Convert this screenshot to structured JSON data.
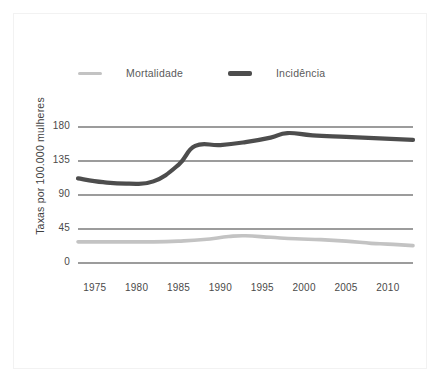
{
  "chart_data": {
    "type": "line",
    "title": "",
    "xlabel": "",
    "ylabel": "Taxas por 100.000 mulheres",
    "xlim": [
      1973,
      2013
    ],
    "ylim": [
      0,
      180
    ],
    "grid": true,
    "legend_position": "top",
    "y_ticks": [
      0,
      45,
      90,
      135,
      180
    ],
    "y_tick_labels": [
      "0",
      "45",
      "90",
      "135",
      "180"
    ],
    "x_ticks": [
      1975,
      1980,
      1985,
      1990,
      1995,
      2000,
      2005,
      2010
    ],
    "x_tick_labels": [
      "1975",
      "1980",
      "1985",
      "1990",
      "1995",
      "2000",
      "2005",
      "2010"
    ],
    "series": [
      {
        "name": "Mortalidade",
        "color": "#c3c3c3",
        "x": [
          1973,
          1976,
          1979,
          1982,
          1985,
          1988,
          1991,
          1993,
          1996,
          1999,
          2002,
          2005,
          2008,
          2010,
          2013
        ],
        "values": [
          28,
          28,
          28,
          28,
          29,
          31,
          35,
          36,
          34,
          32,
          31,
          29,
          26,
          25,
          23
        ]
      },
      {
        "name": "Incidência",
        "color": "#4d4d4d",
        "x": [
          1973,
          1976,
          1979,
          1982,
          1985,
          1987,
          1990,
          1993,
          1996,
          1998,
          2001,
          2005,
          2009,
          2013
        ],
        "values": [
          112,
          107,
          105,
          108,
          130,
          155,
          156,
          160,
          166,
          172,
          169,
          167,
          165,
          163
        ]
      }
    ]
  },
  "legend": {
    "items": [
      {
        "label": "Mortalidade",
        "color": "#c3c3c3"
      },
      {
        "label": "Incidência",
        "color": "#4d4d4d"
      }
    ]
  },
  "axis": {
    "y_title": "Taxas por 100.000 mulheres"
  }
}
